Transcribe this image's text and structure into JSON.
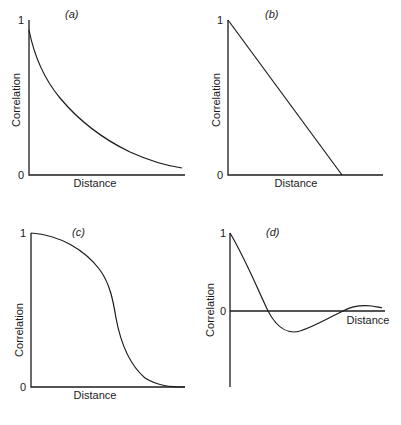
{
  "figure": {
    "colors": {
      "ink": "#1c1c1c",
      "background": "#ffffff"
    }
  },
  "chart_data": [
    {
      "type": "line",
      "panel": "(a)",
      "title": "(a)",
      "xlabel": "Distance",
      "ylabel": "Correlation",
      "yticks": [
        "0",
        "1"
      ],
      "ylim": [
        0,
        1
      ],
      "grid": false,
      "shape": "exponential decay",
      "x": [
        0,
        0.05,
        0.15,
        0.3,
        0.45,
        0.6,
        0.75,
        0.9,
        1.0
      ],
      "values": [
        0.93,
        0.72,
        0.52,
        0.37,
        0.25,
        0.16,
        0.1,
        0.06,
        0.05
      ],
      "svg": {
        "axis_path": "M29,20 L29,175 L185,175",
        "curve_path": "M29,30 C35,60 45,80 60,98 C80,122 105,140 130,152 C150,161 168,166 182,168",
        "tick_labels": [
          {
            "text": "1",
            "x": 18,
            "y": 24
          },
          {
            "text": "0",
            "x": 18,
            "y": 179
          }
        ],
        "panel_label": {
          "text": "(a)",
          "x": 65,
          "y": 18
        },
        "xlabel_pos": {
          "x": 95,
          "y": 187
        },
        "ylabel_pos": {
          "x": 20,
          "y": 100
        }
      }
    },
    {
      "type": "line",
      "panel": "(b)",
      "title": "(b)",
      "xlabel": "Distance",
      "ylabel": "Correlation",
      "yticks": [
        "0",
        "1"
      ],
      "ylim": [
        0,
        1
      ],
      "grid": false,
      "shape": "linear decrease to zero then flat",
      "x": [
        0,
        0.74,
        1.0
      ],
      "values": [
        1.0,
        0.0,
        0.0
      ],
      "svg": {
        "axis_path": "M228,20 L228,175 L383,175",
        "curve_path": "M228,20 L342,175",
        "tick_labels": [
          {
            "text": "1",
            "x": 217,
            "y": 24
          },
          {
            "text": "0",
            "x": 217,
            "y": 179
          }
        ],
        "panel_label": {
          "text": "(b)",
          "x": 265,
          "y": 18
        },
        "xlabel_pos": {
          "x": 296,
          "y": 187
        },
        "ylabel_pos": {
          "x": 220,
          "y": 100
        }
      }
    },
    {
      "type": "line",
      "panel": "(c)",
      "title": "(c)",
      "xlabel": "Distance",
      "ylabel": "Correlation",
      "yticks": [
        "0",
        "1"
      ],
      "ylim": [
        0,
        1
      ],
      "grid": false,
      "shape": "gaussian-like (sigmoid) decay",
      "x": [
        0,
        0.2,
        0.38,
        0.5,
        0.57,
        0.64,
        0.74,
        0.84,
        1.0
      ],
      "values": [
        1.0,
        0.97,
        0.83,
        0.6,
        0.37,
        0.18,
        0.06,
        0.01,
        0.0
      ],
      "svg": {
        "axis_path": "M31,233 L31,387 L185,387",
        "curve_path": "M31,233 C60,235 85,250 100,270 C110,284 113,300 116,318 C121,345 130,365 145,378 C158,386 170,387 185,387",
        "tick_labels": [
          {
            "text": "1",
            "x": 20,
            "y": 237
          },
          {
            "text": "0",
            "x": 20,
            "y": 391
          }
        ],
        "panel_label": {
          "text": "(c)",
          "x": 72,
          "y": 236
        },
        "xlabel_pos": {
          "x": 95,
          "y": 399
        },
        "ylabel_pos": {
          "x": 23,
          "y": 330
        }
      }
    },
    {
      "type": "line",
      "panel": "(d)",
      "title": "(d)",
      "xlabel": "Distance",
      "ylabel": "Correlation",
      "yticks": [
        "0",
        "1"
      ],
      "ylim": [
        -0.7,
        1
      ],
      "grid": false,
      "shape": "damped oscillation (hole effect)",
      "x": [
        0,
        0.1,
        0.26,
        0.42,
        0.6,
        0.72,
        0.85,
        1.0
      ],
      "values": [
        1.0,
        0.6,
        0.0,
        -0.27,
        -0.1,
        0.0,
        0.05,
        0.03
      ],
      "svg": {
        "axis_path": "M230,233 L230,387",
        "zero_line_path": "M230,311 L385,311",
        "curve_path": "M230,233 C245,258 258,290 268,311 C278,330 290,334 300,331 C315,326 330,317 343,311 C352,306 362,305 372,306 C377,307 380,307 382,308",
        "tick_labels": [
          {
            "text": "1",
            "x": 220,
            "y": 237
          },
          {
            "text": "0",
            "x": 220,
            "y": 315
          }
        ],
        "panel_label": {
          "text": "(d)",
          "x": 266,
          "y": 236
        },
        "xlabel_pos": {
          "x": 368,
          "y": 324
        },
        "ylabel_pos": {
          "x": 214,
          "y": 310
        }
      }
    }
  ]
}
